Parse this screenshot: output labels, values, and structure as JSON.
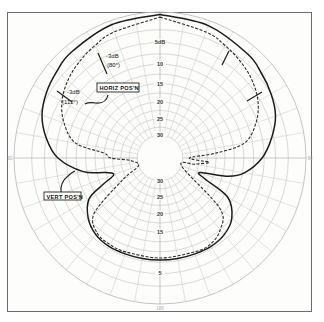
{
  "chart_data": {
    "type": "polar",
    "title": "",
    "radial_axis": {
      "unit": "dB",
      "labels_top": [
        "5dB",
        "10",
        "15",
        "20",
        "25",
        "30"
      ],
      "labels_bottom": [
        "30",
        "25",
        "20",
        "15",
        "5"
      ],
      "ring_values_db": [
        0,
        5,
        10,
        15,
        20,
        25,
        30
      ],
      "scale": "logarithmic-compressed (0 dB at outer ring, 30 dB near center)"
    },
    "angular_axis": {
      "spoke_step_deg": 10,
      "zero_direction": "top",
      "edge_labels": [
        "90",
        "90",
        "180"
      ]
    },
    "grid": true,
    "legend": "callout-labels",
    "series": [
      {
        "name": "VERT POS'N",
        "style": "solid",
        "annotation": "-3dB (112°)",
        "points_deg_db": [
          [
            0,
            0.2
          ],
          [
            20,
            0.5
          ],
          [
            40,
            1.2
          ],
          [
            50,
            1.8
          ],
          [
            60,
            2.5
          ],
          [
            70,
            3.5
          ],
          [
            80,
            5.5
          ],
          [
            90,
            8
          ],
          [
            100,
            12
          ],
          [
            105,
            16
          ],
          [
            110,
            24
          ],
          [
            115,
            22
          ],
          [
            120,
            14
          ],
          [
            130,
            10
          ],
          [
            140,
            8.5
          ],
          [
            150,
            8
          ],
          [
            160,
            8
          ],
          [
            170,
            8
          ],
          [
            180,
            8
          ],
          [
            190,
            8
          ],
          [
            200,
            8
          ],
          [
            210,
            8
          ],
          [
            220,
            8.5
          ],
          [
            230,
            10
          ],
          [
            240,
            13
          ],
          [
            245,
            18
          ],
          [
            250,
            22
          ],
          [
            255,
            20
          ],
          [
            260,
            14
          ],
          [
            270,
            8
          ],
          [
            280,
            5
          ],
          [
            290,
            3
          ],
          [
            300,
            2
          ],
          [
            310,
            1.4
          ],
          [
            320,
            0.9
          ],
          [
            340,
            0.4
          ],
          [
            360,
            0.2
          ]
        ]
      },
      {
        "name": "HORIZ POS'N",
        "style": "dashed",
        "annotation": "-3dB (80°)",
        "points_deg_db": [
          [
            0,
            0.5
          ],
          [
            20,
            1.5
          ],
          [
            30,
            2.2
          ],
          [
            40,
            3.0
          ],
          [
            50,
            4.0
          ],
          [
            60,
            5.5
          ],
          [
            70,
            8
          ],
          [
            80,
            12
          ],
          [
            85,
            20
          ],
          [
            90,
            28
          ],
          [
            95,
            22
          ],
          [
            100,
            26
          ],
          [
            110,
            30
          ],
          [
            130,
            14
          ],
          [
            140,
            10
          ],
          [
            150,
            8.5
          ],
          [
            160,
            8.5
          ],
          [
            180,
            8.5
          ],
          [
            200,
            8.5
          ],
          [
            210,
            8.5
          ],
          [
            220,
            9
          ],
          [
            230,
            12
          ],
          [
            240,
            24
          ],
          [
            250,
            30
          ],
          [
            265,
            28
          ],
          [
            270,
            22
          ],
          [
            275,
            20
          ],
          [
            280,
            12
          ],
          [
            290,
            8
          ],
          [
            300,
            5.5
          ],
          [
            310,
            4
          ],
          [
            320,
            3
          ],
          [
            330,
            2.2
          ],
          [
            340,
            1.5
          ],
          [
            360,
            0.5
          ]
        ]
      }
    ],
    "annotations": [
      {
        "text": "-3dB",
        "sub": "(80°)",
        "series": "HORIZ POS'N"
      },
      {
        "text": "-3dB",
        "sub": "(112°)",
        "series": "VERT POS'N"
      }
    ]
  },
  "callouts": {
    "horiz": "HORIZ POS'N",
    "vert": "VERT POS'N"
  },
  "annotation_text": {
    "horiz_db": "-3dB",
    "horiz_angle": "(80°)",
    "vert_db": "-3dB",
    "vert_angle": "(112°)"
  }
}
